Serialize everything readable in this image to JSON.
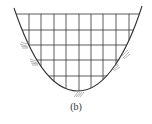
{
  "figure": {
    "caption": "(b)",
    "grid": {
      "horizontal_lines_y": [
        14,
        30,
        45,
        60,
        76
      ],
      "vertical_lines_x": [
        29,
        41,
        54,
        66,
        79,
        91,
        103,
        116,
        129
      ]
    },
    "curve": {
      "top_left": [
        14,
        8
      ],
      "top_right": [
        142,
        6
      ],
      "bottom": [
        78,
        91
      ]
    },
    "supports": [
      {
        "x": 27,
        "y": 45
      },
      {
        "x": 37,
        "y": 62
      },
      {
        "x": 78,
        "y": 94
      },
      {
        "x": 114,
        "y": 65
      },
      {
        "x": 124,
        "y": 52
      }
    ],
    "colors": {
      "line": "#333333",
      "hatch": "#888888"
    }
  }
}
